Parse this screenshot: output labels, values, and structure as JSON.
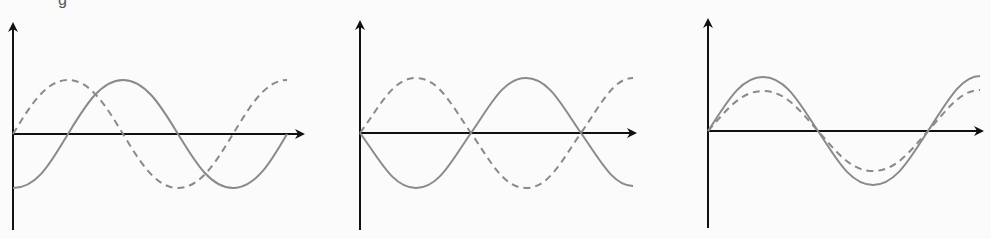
{
  "clipped_caption_fragment": "g",
  "colors": {
    "axis": "#111111",
    "curve": "#8a8a8a",
    "background": "#fbfbfb"
  },
  "panels": [
    {
      "id": "a",
      "description": "Solid and dashed sine waves, equal amplitude, 90° phase shift (dashed leads)",
      "solid": {
        "amplitude": 1.0,
        "phase_deg": -90
      },
      "dashed": {
        "amplitude": 1.0,
        "phase_deg": 0
      }
    },
    {
      "id": "b",
      "description": "Solid and dashed sine waves, equal amplitude, 180° out of phase",
      "solid": {
        "amplitude": 1.0,
        "phase_deg": 180
      },
      "dashed": {
        "amplitude": 1.0,
        "phase_deg": 0
      }
    },
    {
      "id": "c",
      "description": "Solid and dashed sine waves in phase, dashed smaller amplitude",
      "solid": {
        "amplitude": 1.0,
        "phase_deg": 0
      },
      "dashed": {
        "amplitude": 0.75,
        "phase_deg": 0
      }
    }
  ]
}
